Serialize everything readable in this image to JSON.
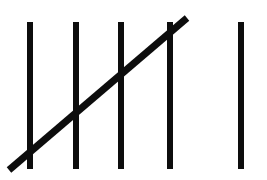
{
  "image": {
    "kind": "tally-marks",
    "title": "Tally marks",
    "description": "Hand-drawn tally marks representing the number six: a completed group of five (four vertical strokes crossed by a diagonal slash) followed by one additional vertical stroke.",
    "total_count": 6,
    "groups_of_five": 1,
    "remainder": 1,
    "width": 267,
    "height": 180,
    "background_color": "#ffffff",
    "ink_color": "#0d0d0d"
  },
  "marks": {
    "group_one": {
      "label": "group-of-five",
      "count": 5,
      "vertical_strokes": [
        {
          "label": "tally-stroke-1",
          "x": 30,
          "y_top": 22,
          "y_bottom": 169,
          "width": 6
        },
        {
          "label": "tally-stroke-2",
          "x": 76,
          "y_top": 22,
          "y_bottom": 169,
          "width": 6
        },
        {
          "label": "tally-stroke-3",
          "x": 121,
          "y_top": 22,
          "y_bottom": 169,
          "width": 6
        },
        {
          "label": "tally-stroke-4",
          "x": 170,
          "y_top": 22,
          "y_bottom": 169,
          "width": 6
        }
      ],
      "diagonal_slash": {
        "label": "tally-stroke-5-slash",
        "x1": 9,
        "y1": 170,
        "x2": 187,
        "y2": 18,
        "width": 7
      }
    },
    "group_two": {
      "label": "single-stroke-group",
      "count": 1,
      "vertical_strokes": [
        {
          "label": "tally-stroke-6",
          "x": 241,
          "y_top": 22,
          "y_bottom": 169,
          "width": 6
        }
      ]
    }
  }
}
